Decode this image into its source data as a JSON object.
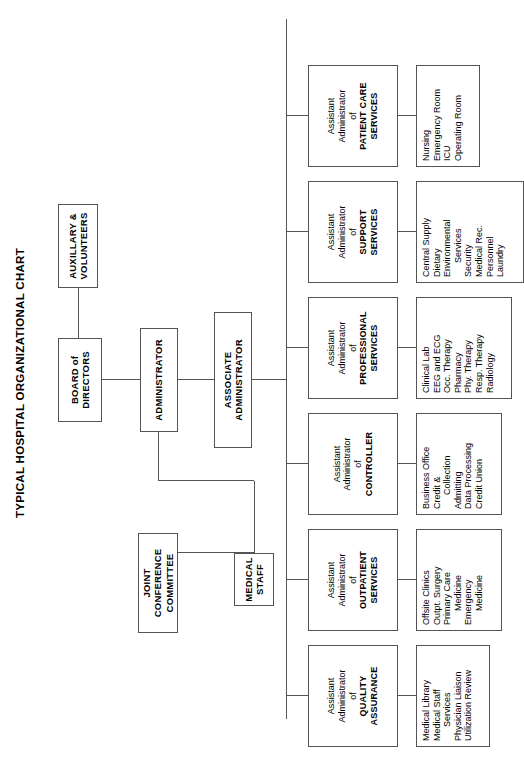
{
  "title": "TYPICAL HOSPITAL ORGANIZATIONAL CHART",
  "colors": {
    "border": "#555555",
    "text": "#000000",
    "background": "#ffffff"
  },
  "governance": {
    "board": {
      "line1": "BOARD of",
      "line2": "DIRECTORS"
    },
    "auxiliary": {
      "line1": "AUXILLARY &",
      "line2": "VOLUNTEERS"
    },
    "administrator": {
      "line1": "ADMINISTRATOR"
    },
    "associate_administrator": {
      "line1": "ASSOCIATE ADMINISTRATOR"
    },
    "medical_staff": {
      "line1": "MEDICAL",
      "line2": "STAFF"
    },
    "joint_conference": {
      "line1": "JOINT CONFERENCE",
      "line2": "COMMITTEE"
    }
  },
  "divisions": [
    {
      "id": "quality-assurance",
      "role_line1": "Assistant",
      "role_line2": "Administrator",
      "role_line3": "of",
      "dept_line1": "QUALITY",
      "dept_line2": "ASSURANCE",
      "services": [
        "Medical Library",
        "Medical Staff",
        "Services",
        "Physician Liaison",
        "Utilization Review"
      ],
      "service_indent": [
        false,
        false,
        true,
        false,
        false
      ]
    },
    {
      "id": "outpatient-services",
      "role_line1": "Assistant",
      "role_line2": "Administrator",
      "role_line3": "of",
      "dept_line1": "OUTPATIENT",
      "dept_line2": "SERVICES",
      "services": [
        "Offsite Clinics",
        "Outpt. Surgery",
        "Primary Care",
        "Medicine",
        "Emergency",
        "Medicine"
      ],
      "service_indent": [
        false,
        false,
        false,
        true,
        false,
        true
      ]
    },
    {
      "id": "controller",
      "role_line1": "Assistant",
      "role_line2": "Administrator",
      "role_line3": "of",
      "dept_line1": "CONTROLLER",
      "dept_line2": "",
      "services": [
        "Business Office",
        "Credit &",
        "Collection",
        "Admitting",
        "Data Processing",
        "Credit Union"
      ],
      "service_indent": [
        false,
        false,
        true,
        false,
        false,
        false
      ]
    },
    {
      "id": "professional-services",
      "role_line1": "Assistant",
      "role_line2": "Administrator",
      "role_line3": "of",
      "dept_line1": "PROFESSIONAL",
      "dept_line2": "SERVICES",
      "services": [
        "Clinical Lab",
        "EEG and ECG",
        "Occ. Therapy",
        "Pharmacy",
        "Phy. Therapy",
        "Resp. Therapy",
        "Radiology"
      ],
      "service_indent": [
        false,
        false,
        false,
        false,
        false,
        false,
        false
      ]
    },
    {
      "id": "support-services",
      "role_line1": "Assistant",
      "role_line2": "Administrator",
      "role_line3": "of",
      "dept_line1": "SUPPORT",
      "dept_line2": "SERVICES",
      "services": [
        "Central Supply",
        "Dietary",
        "Environmental",
        "Services",
        "Security",
        "Medical Rec.",
        "Personnel",
        "Laundry"
      ],
      "service_indent": [
        false,
        false,
        false,
        true,
        false,
        false,
        false,
        false
      ]
    },
    {
      "id": "patient-care-services",
      "role_line1": "Assistant",
      "role_line2": "Administrator",
      "role_line3": "of",
      "dept_line1": "PATIENT CARE",
      "dept_line2": "SERVICES",
      "services": [
        "Nursing",
        "Emergency Room",
        "ICU",
        "Operating Room"
      ],
      "service_indent": [
        false,
        false,
        false,
        false
      ]
    }
  ]
}
